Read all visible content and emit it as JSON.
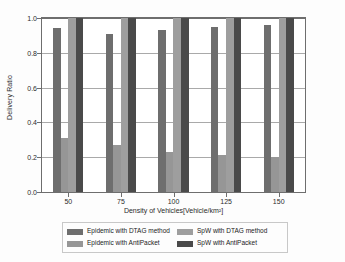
{
  "chart_data": {
    "type": "bar",
    "title": "",
    "xlabel": "Density of Vehicles[Vehicle/km²]",
    "ylabel": "Delivery Ratio",
    "categories": [
      "50",
      "75",
      "100",
      "125",
      "150"
    ],
    "ylim": [
      0.0,
      1.0
    ],
    "yticks": [
      "0.0",
      "0.2",
      "0.4",
      "0.6",
      "0.8",
      "1.0"
    ],
    "ytick_values": [
      0.0,
      0.2,
      0.4,
      0.6,
      0.8,
      1.0
    ],
    "grid": true,
    "legend_position": "below-axes",
    "legend_columns": 2,
    "series": [
      {
        "name": "Epidemic with DTAG method",
        "color": "#6e6e6e",
        "values": [
          0.94,
          0.91,
          0.93,
          0.95,
          0.96
        ]
      },
      {
        "name": "Epidemic with AntiPacket",
        "color": "#969696",
        "values": [
          0.31,
          0.27,
          0.23,
          0.21,
          0.2
        ]
      },
      {
        "name": "SpW with DTAG method",
        "color": "#9e9e9e",
        "values": [
          1.0,
          1.0,
          1.0,
          1.0,
          1.0
        ]
      },
      {
        "name": "SpW with AntiPacket",
        "color": "#4a4a4a",
        "values": [
          1.0,
          1.0,
          1.0,
          1.0,
          1.0
        ]
      }
    ]
  },
  "axes": {
    "frame_color": "#6e6e6e",
    "grid_color": "#a9a9a9",
    "background": "#ffffff"
  }
}
